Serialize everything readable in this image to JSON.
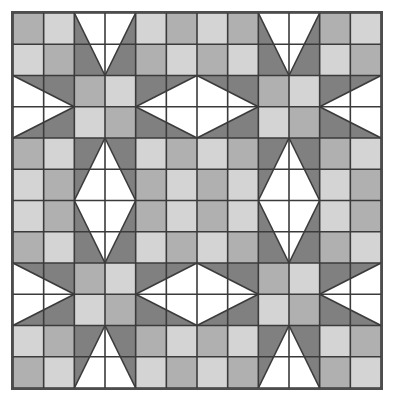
{
  "artwork": {
    "title": "Quilt Block Pattern",
    "kind": "patchwork-quilt-diagram",
    "description": "Two-by-two arrangement of six-by-six LeMoyne-style sawtooth star quilt blocks rendered in three gray values plus white",
    "canvas": {
      "width": 401,
      "height": 409,
      "background": "#ffffff"
    },
    "frame": {
      "x": 11,
      "y": 11,
      "width": 372,
      "height": 379,
      "border_color": "#4d4d4d",
      "border_width": 2
    },
    "grid": {
      "columns": 12,
      "rows": 12,
      "blocks_across": 2,
      "blocks_down": 2,
      "block_cells": 6,
      "seam_color": "#3b3b3b",
      "seam_width": 1.6
    },
    "palette": {
      "white": "#ffffff",
      "light_gray": "#d4d4d4",
      "medium_gray": "#b0b0b0",
      "dark_gray": "#808080",
      "seam": "#3b3b3b",
      "border": "#4d4d4d"
    },
    "legend": [
      {
        "name": "white",
        "label": "White",
        "color": "#ffffff"
      },
      {
        "name": "light-gray",
        "label": "Light Gray",
        "color": "#d4d4d4"
      },
      {
        "name": "medium-gray",
        "label": "Medium Gray",
        "color": "#b0b0b0"
      },
      {
        "name": "dark-gray",
        "label": "Dark Gray",
        "color": "#808080"
      }
    ],
    "block": {
      "name": "sawtooth-star",
      "corner_unit": {
        "name": "four-patch-corner",
        "size_cells": 2,
        "cells": [
          [
            "medium_gray",
            "light_gray"
          ],
          [
            "light_gray",
            "medium_gray"
          ]
        ],
        "alternate_cells": [
          [
            "light_gray",
            "medium_gray"
          ],
          [
            "medium_gray",
            "light_gray"
          ]
        ]
      },
      "star_point": {
        "name": "flying-geese-point",
        "span_cells": 2,
        "depth_cells": 2,
        "point_color": "dark_gray",
        "background_color": "white"
      },
      "center_unit": {
        "name": "four-patch-center",
        "size_cells": 2,
        "cells": [
          [
            "medium_gray",
            "light_gray"
          ],
          [
            "light_gray",
            "medium_gray"
          ]
        ]
      }
    },
    "quadrants": [
      {
        "name": "top-left-block",
        "row": 0,
        "col": 0,
        "corner_parity": 0
      },
      {
        "name": "top-right-block",
        "row": 0,
        "col": 1,
        "corner_parity": 1
      },
      {
        "name": "bottom-left-block",
        "row": 1,
        "col": 0,
        "corner_parity": 1
      },
      {
        "name": "bottom-right-block",
        "row": 1,
        "col": 1,
        "corner_parity": 0
      }
    ]
  }
}
